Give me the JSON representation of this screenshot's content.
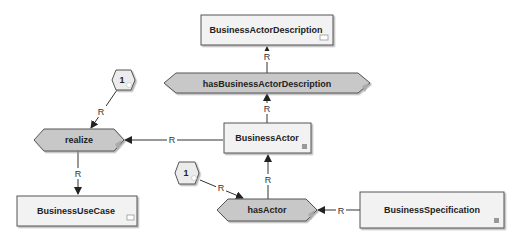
{
  "diagram": {
    "colors": {
      "box_fill": "#f2f2f2",
      "box_stroke": "#555555",
      "hex_fill": "#c8c8c8",
      "line": "#333333"
    },
    "nodes": {
      "business_actor_description": {
        "label": "BusinessActorDescription",
        "type": "entity",
        "icon": "object-icon"
      },
      "has_business_actor_description": {
        "label": "hasBusinessActorDescription",
        "type": "relation"
      },
      "business_actor": {
        "label": "BusinessActor",
        "type": "entity",
        "icon": "square-icon"
      },
      "cardinality_top": {
        "label": "1",
        "type": "cardinality"
      },
      "realize": {
        "label": "realize",
        "type": "relation"
      },
      "business_use_case": {
        "label": "BusinessUseCase",
        "type": "entity",
        "icon": "object-icon"
      },
      "cardinality_bottom": {
        "label": "1",
        "type": "cardinality"
      },
      "has_actor": {
        "label": "hasActor",
        "type": "relation"
      },
      "business_specification": {
        "label": "BusinessSpecification",
        "type": "entity",
        "icon": "square-icon"
      }
    },
    "edges": [
      {
        "from": "has_business_actor_description",
        "to": "business_actor_description",
        "label": "R"
      },
      {
        "from": "business_actor",
        "to": "has_business_actor_description",
        "label": "R"
      },
      {
        "from": "business_actor",
        "to": "realize",
        "label": "R"
      },
      {
        "from": "cardinality_top",
        "to": "realize",
        "label": "R"
      },
      {
        "from": "realize",
        "to": "business_use_case",
        "label": "R"
      },
      {
        "from": "has_actor",
        "to": "business_actor",
        "label": "R"
      },
      {
        "from": "cardinality_bottom",
        "to": "has_actor",
        "label": "R"
      },
      {
        "from": "business_specification",
        "to": "has_actor",
        "label": "R"
      }
    ]
  }
}
